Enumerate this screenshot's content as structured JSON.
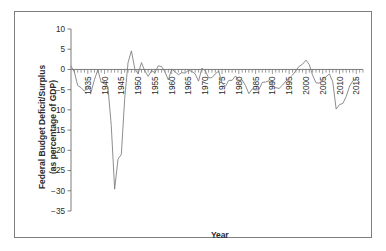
{
  "chart_data": {
    "type": "line",
    "title": "",
    "xlabel": "Year",
    "ylabel": "Federal Budget Deficit/Surplus (as percentage of GDP)",
    "ylabel_line1": "Federal Budget Deficit/Surplus",
    "ylabel_line2": "(as percentage of GDP)",
    "xlim": [
      1930,
      2017
    ],
    "ylim": [
      -35,
      10
    ],
    "yticks": [
      10,
      5,
      0,
      -5,
      -10,
      -15,
      -20,
      -25,
      -30,
      -35
    ],
    "ytick_labels": [
      "10",
      "5",
      "0",
      "−5",
      "−10",
      "−15",
      "−20",
      "−25",
      "−30",
      "−35"
    ],
    "xticks": [
      1935,
      1940,
      1945,
      1950,
      1955,
      1960,
      1965,
      1970,
      1975,
      1980,
      1985,
      1990,
      1995,
      2000,
      2005,
      2010,
      2015
    ],
    "xtick_labels": [
      "1935",
      "1940",
      "1945",
      "1950",
      "1955",
      "1960",
      "1965",
      "1970",
      "1975",
      "1980",
      "1985",
      "1990",
      "1995",
      "2000",
      "2005",
      "2010",
      "2015"
    ],
    "xtick_label_rotation": -90,
    "minor_ticks": true,
    "grid": false,
    "legend": false,
    "line_color": "#7a7a7a",
    "axis_color": "#6e6e6e",
    "text_color": "#2b2b2b",
    "series": [
      {
        "name": "Federal Budget Deficit/Surplus",
        "x": [
          1930,
          1931,
          1932,
          1933,
          1934,
          1935,
          1936,
          1937,
          1938,
          1939,
          1940,
          1941,
          1942,
          1943,
          1944,
          1945,
          1946,
          1947,
          1948,
          1949,
          1950,
          1951,
          1952,
          1953,
          1954,
          1955,
          1956,
          1957,
          1958,
          1959,
          1960,
          1961,
          1962,
          1963,
          1964,
          1965,
          1966,
          1967,
          1968,
          1969,
          1970,
          1971,
          1972,
          1973,
          1974,
          1975,
          1976,
          1977,
          1978,
          1979,
          1980,
          1981,
          1982,
          1983,
          1984,
          1985,
          1986,
          1987,
          1988,
          1989,
          1990,
          1991,
          1992,
          1993,
          1994,
          1995,
          1996,
          1997,
          1998,
          1999,
          2000,
          2001,
          2002,
          2003,
          2004,
          2005,
          2006,
          2007,
          2008,
          2009,
          2010,
          2011,
          2012,
          2013,
          2014,
          2015,
          2016
        ],
        "values": [
          0.8,
          -0.6,
          -4.0,
          -4.5,
          -5.4,
          -4.0,
          -5.5,
          -2.5,
          -0.1,
          -3.2,
          -3.0,
          -4.3,
          -13.9,
          -29.6,
          -22.2,
          -21.0,
          -7.2,
          1.7,
          4.6,
          0.2,
          -1.1,
          1.7,
          -0.4,
          -1.7,
          -0.3,
          -0.8,
          0.9,
          0.7,
          -0.6,
          -2.6,
          0.1,
          -0.6,
          -1.3,
          -0.8,
          -0.9,
          -0.2,
          -0.5,
          -1.1,
          -2.9,
          0.3,
          -0.3,
          -2.1,
          -2.0,
          -1.1,
          -0.4,
          -3.4,
          -4.2,
          -2.7,
          -2.7,
          -1.6,
          -2.7,
          -2.6,
          -4.0,
          -6.0,
          -4.8,
          -5.1,
          -5.0,
          -3.2,
          -3.1,
          -2.8,
          -3.9,
          -4.5,
          -4.7,
          -3.9,
          -2.9,
          -2.2,
          -1.4,
          -0.3,
          0.8,
          1.3,
          2.3,
          1.2,
          -1.5,
          -3.3,
          -3.4,
          -2.5,
          -1.8,
          -1.1,
          -3.1,
          -9.8,
          -8.7,
          -8.4,
          -6.7,
          -4.1,
          -2.8,
          -2.4,
          -3.2
        ]
      }
    ]
  },
  "figure": {
    "border_color": "#7d7d7d",
    "background": "#ffffff"
  }
}
